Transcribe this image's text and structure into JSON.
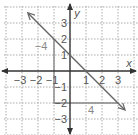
{
  "chart_data": {
    "type": "line",
    "title": "",
    "xlabel": "x",
    "ylabel": "y",
    "xlim": [
      -4,
      4
    ],
    "ylim": [
      -4,
      4
    ],
    "grid": true,
    "x_ticks": [
      -3,
      -2,
      -1,
      1,
      2,
      3
    ],
    "y_ticks": [
      3,
      2,
      1,
      -1,
      -2,
      -3
    ],
    "x_tick_labels": [
      "−3",
      "−2",
      "−1",
      "1",
      "2",
      "3"
    ],
    "y_tick_labels": [
      "3",
      "2",
      "1",
      "−1",
      "−2",
      "−3"
    ],
    "series": [
      {
        "name": "line",
        "equation": "y = -x + 1",
        "slope": -1,
        "y_intercept": 1,
        "x": [
          -2.6,
          3.4
        ],
        "y": [
          3.6,
          -2.4
        ],
        "arrows_both_ends": true
      }
    ],
    "slope_triangle": {
      "points": [
        [
          -1,
          2
        ],
        [
          -1,
          -2
        ],
        [
          3,
          -2
        ]
      ],
      "rise": -4,
      "run": 4,
      "rise_label": "−4",
      "run_label": "4"
    }
  },
  "colors": {
    "axis": "#333333",
    "grid": "#aaaaaa",
    "line": "#666666",
    "triangle": "#888888",
    "label": "#555555",
    "leg_label": "#888888"
  }
}
